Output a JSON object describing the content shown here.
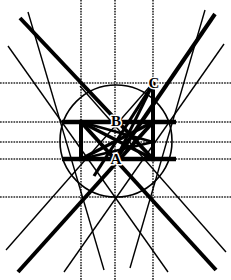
{
  "figure": {
    "type": "line-geometry",
    "canvas": {
      "width": 231,
      "height": 280
    },
    "colors": {
      "ink": "#000000",
      "background": "#ffffff",
      "grid": "#2b2b2b"
    },
    "point_labels": [
      {
        "id": "A",
        "text": "A",
        "x": 116,
        "y": 164
      },
      {
        "id": "B",
        "text": "B",
        "x": 116,
        "y": 126
      },
      {
        "id": "C",
        "text": "C",
        "x": 154,
        "y": 88
      }
    ],
    "circle": {
      "cx": 116,
      "cy": 141,
      "r": 56,
      "stroke_width": 1.6
    },
    "grid_vertical_x": [
      81,
      115,
      153
    ],
    "grid_horizontal_y": [
      83,
      122,
      142,
      159,
      197
    ],
    "grid_stroke_width": 1.6,
    "thick_segments": [
      {
        "name": "upper-horizontal-bar",
        "x1": 62,
        "y1": 122,
        "x2": 176,
        "y2": 122,
        "w": 4.5
      },
      {
        "name": "lower-horizontal-bar",
        "x1": 62,
        "y1": 159,
        "x2": 176,
        "y2": 159,
        "w": 4.5
      },
      {
        "name": "left-vertical-bar",
        "x1": 81,
        "y1": 122,
        "x2": 81,
        "y2": 159,
        "w": 4.0
      },
      {
        "name": "right-vertical-bar",
        "x1": 153,
        "y1": 122,
        "x2": 153,
        "y2": 159,
        "w": 4.0
      },
      {
        "name": "right-vertical-upper",
        "x1": 153,
        "y1": 84,
        "x2": 153,
        "y2": 122,
        "w": 4.0
      },
      {
        "name": "box-diagonal-nw-se",
        "x1": 81,
        "y1": 122,
        "x2": 153,
        "y2": 159,
        "w": 3.6
      },
      {
        "name": "box-diagonal-sw-ne",
        "x1": 81,
        "y1": 159,
        "x2": 153,
        "y2": 122,
        "w": 3.6
      },
      {
        "name": "inner-cross-a",
        "x1": 81,
        "y1": 122,
        "x2": 153,
        "y2": 142,
        "w": 2.6
      },
      {
        "name": "inner-cross-b",
        "x1": 81,
        "y1": 159,
        "x2": 153,
        "y2": 142,
        "w": 2.6
      },
      {
        "name": "long-diagonal-tl",
        "x1": 20,
        "y1": 18,
        "x2": 153,
        "y2": 159,
        "w": 4.0
      },
      {
        "name": "long-diagonal-tr",
        "x1": 215,
        "y1": 14,
        "x2": 116,
        "y2": 159,
        "w": 4.0
      },
      {
        "name": "long-diagonal-bl",
        "x1": 18,
        "y1": 272,
        "x2": 153,
        "y2": 122,
        "w": 4.0
      },
      {
        "name": "long-diagonal-br",
        "x1": 216,
        "y1": 270,
        "x2": 81,
        "y2": 122,
        "w": 4.0
      },
      {
        "name": "steep-c-ray",
        "x1": 153,
        "y1": 84,
        "x2": 94,
        "y2": 176,
        "w": 3.2
      },
      {
        "name": "c-to-lower-left",
        "x1": 153,
        "y1": 84,
        "x2": 116,
        "y2": 159,
        "w": 3.0
      }
    ],
    "thin_lines": [
      {
        "name": "thin-tl-steep",
        "x1": 28,
        "y1": 12,
        "x2": 104,
        "y2": 270,
        "w": 1.4
      },
      {
        "name": "thin-tr-steep",
        "x1": 205,
        "y1": 10,
        "x2": 130,
        "y2": 268,
        "w": 1.4
      },
      {
        "name": "thin-left-shallow",
        "x1": 8,
        "y1": 46,
        "x2": 168,
        "y2": 272,
        "w": 1.4
      },
      {
        "name": "thin-right-shallow",
        "x1": 224,
        "y1": 44,
        "x2": 64,
        "y2": 272,
        "w": 1.4
      },
      {
        "name": "thin-bl-rising",
        "x1": 6,
        "y1": 250,
        "x2": 152,
        "y2": 84,
        "w": 1.4
      },
      {
        "name": "thin-br-rising",
        "x1": 226,
        "y1": 252,
        "x2": 80,
        "y2": 86,
        "w": 1.4
      }
    ],
    "vertex_dots": [
      {
        "x": 81,
        "y": 122,
        "r": 2.6
      },
      {
        "x": 153,
        "y": 122,
        "r": 2.6
      },
      {
        "x": 81,
        "y": 159,
        "r": 2.6
      },
      {
        "x": 153,
        "y": 159,
        "r": 2.6
      },
      {
        "x": 153,
        "y": 84,
        "r": 2.6
      }
    ]
  }
}
